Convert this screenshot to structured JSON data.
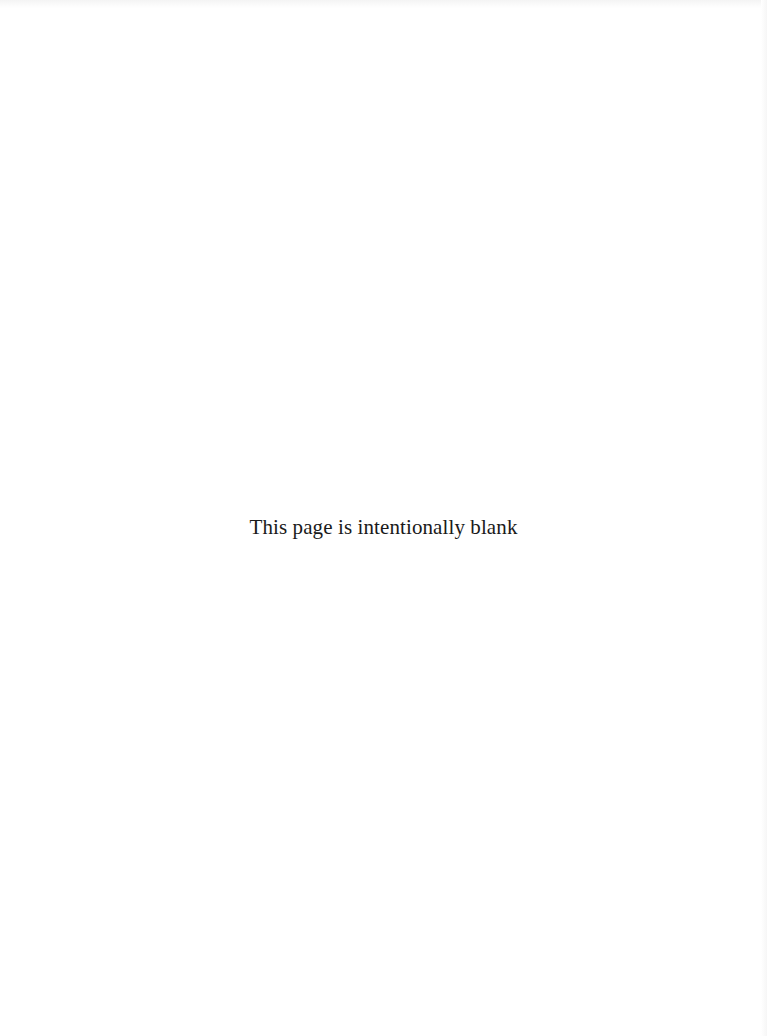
{
  "page": {
    "notice": "This page is intentionally blank",
    "background_color": "#ffffff",
    "text_color": "#1a1a1a"
  }
}
